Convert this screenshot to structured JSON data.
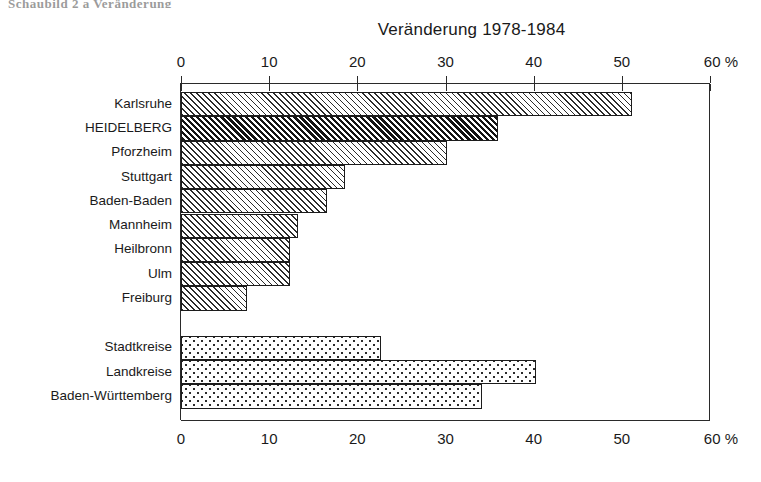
{
  "page": {
    "top_fragment": "Schaubild 2 a   Veränderung",
    "title": "Veränderung 1978-1984"
  },
  "axis": {
    "unit_suffix": "%",
    "tick_labels": [
      "0",
      "10",
      "20",
      "30",
      "40",
      "50",
      "60 %"
    ],
    "tick_values": [
      0,
      10,
      20,
      30,
      40,
      50,
      60
    ]
  },
  "chart_data": {
    "type": "bar",
    "orientation": "horizontal",
    "title": "Veränderung 1978-1984",
    "xlabel": "%",
    "ylabel": "",
    "xlim": [
      0,
      60
    ],
    "grid": false,
    "legend": null,
    "categories": [
      "Karlsruhe",
      "HEIDELBERG",
      "Pforzheim",
      "Stuttgart",
      "Baden-Baden",
      "Mannheim",
      "Heilbronn",
      "Ulm",
      "Freiburg",
      "Stadtkreise",
      "Landkreise",
      "Baden-Württemberg"
    ],
    "values": [
      51.1,
      36.0,
      30.2,
      18.6,
      16.6,
      13.3,
      12.4,
      12.4,
      7.5,
      22.7,
      40.3,
      34.1
    ],
    "groups": [
      {
        "name": "Stadtkreise (einzeln)",
        "fill": "hatch-light",
        "highlight_fill": "hatch-dark",
        "highlight_category": "HEIDELBERG",
        "items": [
          {
            "label": "Karlsruhe",
            "value": 51.1,
            "fill": "hatch-light"
          },
          {
            "label": "HEIDELBERG",
            "value": 36.0,
            "fill": "hatch-dark"
          },
          {
            "label": "Pforzheim",
            "value": 30.2,
            "fill": "hatch-light"
          },
          {
            "label": "Stuttgart",
            "value": 18.6,
            "fill": "hatch-light"
          },
          {
            "label": "Baden-Baden",
            "value": 16.6,
            "fill": "hatch-light"
          },
          {
            "label": "Mannheim",
            "value": 13.3,
            "fill": "hatch-light"
          },
          {
            "label": "Heilbronn",
            "value": 12.4,
            "fill": "hatch-light"
          },
          {
            "label": "Ulm",
            "value": 12.4,
            "fill": "hatch-light"
          },
          {
            "label": "Freiburg",
            "value": 7.5,
            "fill": "hatch-light"
          }
        ]
      },
      {
        "name": "Aggregate",
        "fill": "stipple",
        "items": [
          {
            "label": "Stadtkreise",
            "value": 22.7,
            "fill": "stipple"
          },
          {
            "label": "Landkreise",
            "value": 40.3,
            "fill": "stipple"
          },
          {
            "label": "Baden-Württemberg",
            "value": 34.1,
            "fill": "stipple"
          }
        ]
      }
    ]
  },
  "colors": {
    "ink": "#1a1a1a",
    "axis": "#2a2a2a",
    "background": "#ffffff"
  }
}
